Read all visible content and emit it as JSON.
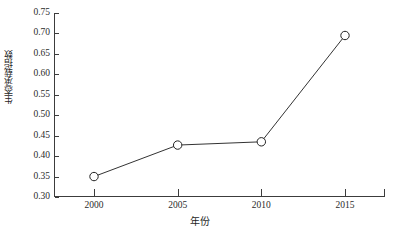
{
  "chart_data": {
    "type": "line",
    "title": "",
    "xlabel": "年份",
    "ylabel": "生态承载指数",
    "categories": [
      "2000",
      "2005",
      "2010",
      "2015"
    ],
    "values": [
      0.35,
      0.427,
      0.435,
      0.695
    ],
    "series": [
      {
        "name": "生态承载指数",
        "values": [
          0.35,
          0.427,
          0.435,
          0.695
        ]
      }
    ],
    "ylim": [
      0.3,
      0.75
    ],
    "ytick_labels": [
      "0.30",
      "0.35",
      "0.40",
      "0.45",
      "0.50",
      "0.55",
      "0.60",
      "0.65",
      "0.70",
      "0.75"
    ],
    "ytick_values": [
      0.3,
      0.35,
      0.4,
      0.45,
      0.5,
      0.55,
      0.6,
      0.65,
      0.7,
      0.75
    ],
    "grid": false,
    "legend": "none",
    "marker": "open-circle",
    "line_color": "#333333",
    "marker_color": "#222222",
    "marker_fill": "#ffffff",
    "background_color": "#ffffff",
    "axis_color": "#3c3c3c"
  }
}
